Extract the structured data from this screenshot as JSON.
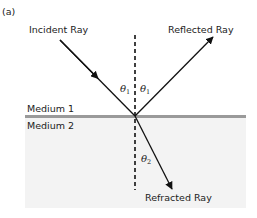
{
  "figure": {
    "panel_label": "(a)",
    "rays": {
      "incident": {
        "label": "Incident Ray"
      },
      "reflected": {
        "label": "Reflected Ray"
      },
      "refracted": {
        "label": "Refracted Ray"
      }
    },
    "angles": {
      "incident": {
        "symbol": "θ",
        "subscript": "1"
      },
      "reflected": {
        "symbol": "θ",
        "subscript": "1"
      },
      "refracted": {
        "symbol": "θ",
        "subscript": "2"
      }
    },
    "media": {
      "upper": {
        "label": "Medium 1"
      },
      "lower": {
        "label": "Medium 2"
      }
    },
    "colors": {
      "interface_line": "#9a9a9a",
      "medium2_fill": "#f3f3f3",
      "ray": "#111111"
    }
  }
}
